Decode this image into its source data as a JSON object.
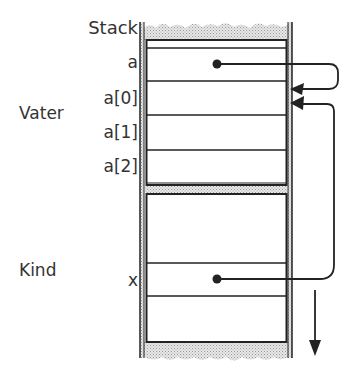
{
  "diagram": {
    "stack_title": "Stack",
    "frames": [
      {
        "name": "Vater",
        "slots": [
          "",
          "a",
          "a[0]",
          "a[1]",
          "a[2]"
        ]
      },
      {
        "name": "Kind",
        "slots": [
          "",
          "",
          "x",
          ""
        ]
      }
    ],
    "labels": {
      "stack": "Stack",
      "a": "a",
      "a0": "a[0]",
      "a1": "a[1]",
      "a2": "a[2]",
      "vater": "Vater",
      "kind": "Kind",
      "x": "x"
    },
    "pointers": [
      {
        "from": "a",
        "to": "a[0]"
      },
      {
        "from": "x",
        "to": "a[0]"
      }
    ],
    "growth_direction": "down",
    "colors": {
      "line": "#222222",
      "hatch": "#bbbbbb",
      "text": "#333333"
    }
  }
}
